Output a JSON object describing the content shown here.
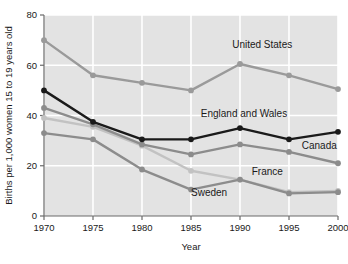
{
  "chart_data": {
    "type": "line",
    "title": "",
    "xlabel": "Year",
    "ylabel": "Births per 1,000 women 15 to 19 years old",
    "x": [
      1970,
      1975,
      1980,
      1985,
      1990,
      1995,
      2000
    ],
    "xticklabels": [
      "1970",
      "1975",
      "1980",
      "1985",
      "1990",
      "1995",
      "2000"
    ],
    "yticklabels": [
      "0",
      "20",
      "40",
      "60",
      "80"
    ],
    "yticks": [
      0,
      20,
      40,
      60,
      80
    ],
    "xlim": [
      1970,
      2000
    ],
    "ylim": [
      0,
      80
    ],
    "grid": "white gridlines on light gray panel",
    "legend_position": "inline labels next to series",
    "series": [
      {
        "name": "United States",
        "values": [
          70,
          56,
          53,
          50,
          60.5,
          56,
          50.5
        ],
        "color": "#9a9a9a",
        "label_x": 1989.2,
        "label_y": 67,
        "label_anchor": "start"
      },
      {
        "name": "England and Wales",
        "values": [
          50,
          37.5,
          30.5,
          30.5,
          35,
          30.5,
          33.5
        ],
        "color": "#1a1a1a",
        "label_x": 1986.0,
        "label_y": 39.5,
        "label_anchor": "start"
      },
      {
        "name": "Canada",
        "values": [
          43,
          36.5,
          28.5,
          24.5,
          28.5,
          25.5,
          21
        ],
        "color": "#8c8c8c",
        "label_x": 1996.3,
        "label_y": 26.5,
        "label_anchor": "start"
      },
      {
        "name": "France",
        "values": [
          39,
          35.5,
          28,
          18,
          14.5,
          9.5,
          10
        ],
        "color": "#c2c2c2",
        "label_x": 1991.2,
        "label_y": 16.5,
        "label_anchor": "start"
      },
      {
        "name": "Sweden",
        "values": [
          33,
          30.5,
          18.5,
          10.5,
          14.5,
          9,
          9.5
        ],
        "color": "#8c8c8c",
        "label_x": 1985.0,
        "label_y": 8.0,
        "label_anchor": "start"
      }
    ],
    "panel_background": "#e3e3e3",
    "gridline_color": "#ffffff",
    "axis_color": "#6b6b6b"
  }
}
